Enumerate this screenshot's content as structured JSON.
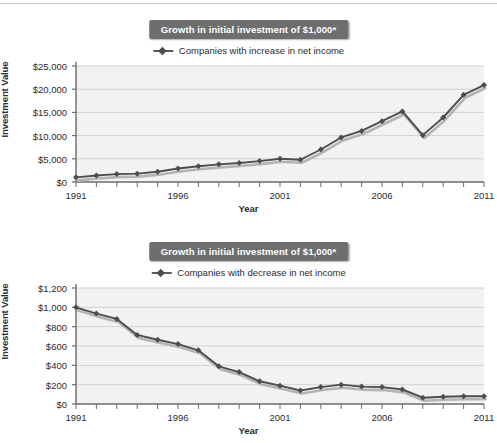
{
  "figures": [
    {
      "title": "Growth in initial investment of $1,000*",
      "legend_label": "Companies with increase in net income",
      "ylabel": "Investment Value",
      "xlabel": "Year"
    },
    {
      "title": "Growth in initial investment of $1,000*",
      "legend_label": "Companies with decrease in net income",
      "ylabel": "Investment Value",
      "xlabel": "Year"
    }
  ],
  "colors": {
    "title_background": "#6e6e6e",
    "title_text": "#ffffff",
    "series_line": "#4d4d4d",
    "series_shadow": "#b4b4b4",
    "plot_background": "#f2f2f2",
    "gridline": "#d2d2d2",
    "axis": "#6b6b6b"
  },
  "chart_data": [
    {
      "type": "line",
      "title": "Growth in initial investment of $1,000*",
      "xlabel": "Year",
      "ylabel": "Investment Value",
      "legend": [
        "Companies with increase in net income"
      ],
      "legend_position": "top-center",
      "grid": true,
      "xlim": [
        1991,
        2011
      ],
      "ylim": [
        0,
        25000
      ],
      "ytick_labels": [
        "$0",
        "$5,000",
        "$10,000",
        "$15,000",
        "$20,000",
        "$25,000"
      ],
      "ytick_values": [
        0,
        5000,
        10000,
        15000,
        20000,
        25000
      ],
      "xtick_labels": [
        "1991",
        "1996",
        "2001",
        "2006",
        "2011"
      ],
      "xtick_values": [
        1991,
        1996,
        2001,
        2006,
        2011
      ],
      "x": [
        1991,
        1992,
        1993,
        1994,
        1995,
        1996,
        1997,
        1998,
        1999,
        2000,
        2001,
        2002,
        2003,
        2004,
        2005,
        2006,
        2007,
        2008,
        2009,
        2010,
        2011
      ],
      "series": [
        {
          "name": "Companies with increase in net income",
          "values": [
            1000,
            1400,
            1700,
            1800,
            2200,
            2900,
            3400,
            3800,
            4100,
            4500,
            5000,
            4800,
            7000,
            9600,
            11000,
            13100,
            15200,
            10100,
            13900,
            18800,
            20900
          ]
        }
      ]
    },
    {
      "type": "line",
      "title": "Growth in initial investment of $1,000*",
      "xlabel": "Year",
      "ylabel": "Investment Value",
      "legend": [
        "Companies with decrease in net income"
      ],
      "legend_position": "top-center",
      "grid": true,
      "xlim": [
        1991,
        2011
      ],
      "ylim": [
        0,
        1200
      ],
      "ytick_labels": [
        "$0",
        "$200",
        "$400",
        "$600",
        "$800",
        "$1,000",
        "$1,200"
      ],
      "ytick_values": [
        0,
        200,
        400,
        600,
        800,
        1000,
        1200
      ],
      "xtick_labels": [
        "1991",
        "1996",
        "2001",
        "2006",
        "2011"
      ],
      "xtick_values": [
        1991,
        1996,
        2001,
        2006,
        2011
      ],
      "x": [
        1991,
        1992,
        1993,
        1994,
        1995,
        1996,
        1997,
        1998,
        1999,
        2000,
        2001,
        2002,
        2003,
        2004,
        2005,
        2006,
        2007,
        2008,
        2009,
        2010,
        2011
      ],
      "series": [
        {
          "name": "Companies with decrease in net income",
          "values": [
            1000,
            935,
            880,
            715,
            665,
            620,
            555,
            390,
            330,
            235,
            190,
            140,
            175,
            200,
            180,
            175,
            150,
            65,
            75,
            80,
            80
          ]
        }
      ]
    }
  ]
}
